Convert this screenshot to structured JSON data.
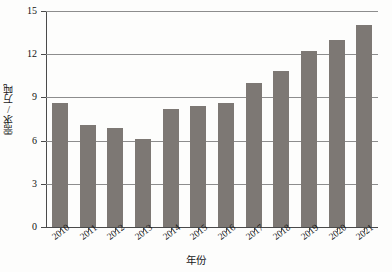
{
  "chart_data": {
    "type": "bar",
    "title": "",
    "xlabel": "年份",
    "ylabel": "需求/万吨",
    "categories": [
      "2010",
      "2011",
      "2012",
      "2013",
      "2014",
      "2015",
      "2016",
      "2017",
      "2018",
      "2019",
      "2020",
      "2021"
    ],
    "values": [
      8.6,
      7.1,
      6.9,
      6.1,
      8.2,
      8.4,
      8.6,
      10.0,
      10.8,
      12.2,
      13.0,
      14.0
    ],
    "ylim": [
      0,
      15
    ],
    "yticks": [
      "0",
      "3",
      "6",
      "9",
      "12",
      "15"
    ],
    "ytick_values": [
      0,
      3,
      6,
      9,
      12,
      15
    ],
    "grid": true,
    "legend": "none",
    "bar_color": "#7d7874",
    "grid_color": "#8d8d8d",
    "axis_color": "#4a4a4a",
    "background": "#fdfdfc"
  }
}
